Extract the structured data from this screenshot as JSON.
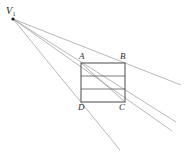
{
  "figure": {
    "canvas": {
      "width": 185,
      "height": 154,
      "background": "#ffffff"
    },
    "vanishing_point": {
      "id": "V1",
      "label": "V",
      "subscript": "1",
      "x": 13,
      "y": 19,
      "dot_radius": 1.6,
      "dot_color": "#1a1a1a",
      "label_x": 6,
      "label_y": 6
    },
    "rectangle": {
      "name": "ABCD",
      "left": 81,
      "top": 63,
      "right": 125,
      "bottom": 102,
      "stroke": "#5a5a5a",
      "stroke_width": 1.1,
      "vertices": [
        {
          "id": "A",
          "label": "A",
          "x": 81,
          "y": 63,
          "label_x": 79,
          "label_y": 52
        },
        {
          "id": "B",
          "label": "B",
          "x": 125,
          "y": 63,
          "label_x": 120,
          "label_y": 52
        },
        {
          "id": "C",
          "label": "C",
          "x": 125,
          "y": 102,
          "label_x": 119,
          "label_y": 103
        },
        {
          "id": "D",
          "label": "D",
          "x": 81,
          "y": 102,
          "label_x": 78,
          "label_y": 103
        }
      ]
    },
    "division_lines": [
      {
        "id": "division-1",
        "x1": 81,
        "y1": 76,
        "x2": 125,
        "y2": 76,
        "stroke": "#6e6e6e"
      },
      {
        "id": "division-2",
        "x1": 81,
        "y1": 89,
        "x2": 125,
        "y2": 89,
        "stroke": "#6e6e6e"
      }
    ],
    "diagonal": {
      "id": "diagonal-AC",
      "from": "A",
      "to": "C",
      "x1": 81,
      "y1": 63,
      "x2": 125,
      "y2": 102,
      "stroke": "#9a9a9a"
    },
    "rays": [
      {
        "id": "ray-top",
        "through": "A-B",
        "x1": 13,
        "y1": 19,
        "x2": 181,
        "y2": 85,
        "stroke": "#9a9a9a"
      },
      {
        "id": "ray-upper-mid",
        "through": "division-1-right",
        "x1": 13,
        "y1": 19,
        "x2": 176,
        "y2": 122,
        "stroke": "#9a9a9a"
      },
      {
        "id": "ray-lower-mid",
        "through": "D-C",
        "x1": 13,
        "y1": 19,
        "x2": 172,
        "y2": 131,
        "stroke": "#9a9a9a"
      },
      {
        "id": "ray-bottom",
        "through": "D-descending",
        "x1": 13,
        "y1": 19,
        "x2": 120,
        "y2": 150,
        "stroke": "#9a9a9a"
      }
    ]
  }
}
